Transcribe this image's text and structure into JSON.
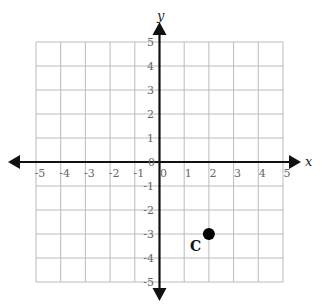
{
  "chart_data": {
    "type": "scatter",
    "title": "",
    "xlabel": "x",
    "ylabel": "y",
    "xlim": [
      -5,
      5
    ],
    "ylim": [
      -5,
      5
    ],
    "grid": true,
    "x_ticks": [
      "-5",
      "-4",
      "-3",
      "-2",
      "-1",
      "0",
      "1",
      "2",
      "3",
      "4",
      "5"
    ],
    "y_ticks": [
      "5",
      "4",
      "3",
      "2",
      "1",
      "0",
      "-1",
      "-2",
      "-3",
      "-4",
      "-5"
    ],
    "points": [
      {
        "label": "C",
        "x": 2,
        "y": -3
      }
    ]
  }
}
